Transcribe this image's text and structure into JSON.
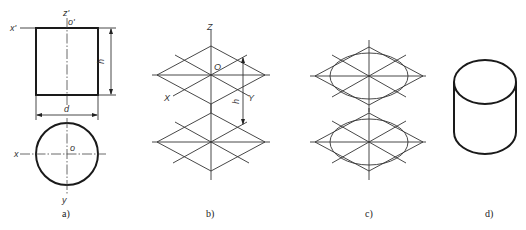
{
  "figure": {
    "subfigures": [
      {
        "id": "a",
        "caption": "a)",
        "description": "Orthographic projection views of a cylinder",
        "front_view": {
          "axis_labels": {
            "x": "x'",
            "z": "z'",
            "origin": "o'"
          },
          "dimensions": {
            "height": "h",
            "diameter": "d"
          }
        },
        "top_view": {
          "axis_labels": {
            "x": "x",
            "y": "y",
            "origin": "o"
          }
        }
      },
      {
        "id": "b",
        "caption": "b)",
        "description": "Isometric axes with two rhombuses separated by height h",
        "axis_labels": {
          "z": "Z",
          "x": "X",
          "y": "Y",
          "origin": "O"
        },
        "dimension": "h"
      },
      {
        "id": "c",
        "caption": "c)",
        "description": "Approximate ellipses inscribed in rhombuses"
      },
      {
        "id": "d",
        "caption": "d)",
        "description": "Finished isometric cylinder"
      }
    ]
  }
}
